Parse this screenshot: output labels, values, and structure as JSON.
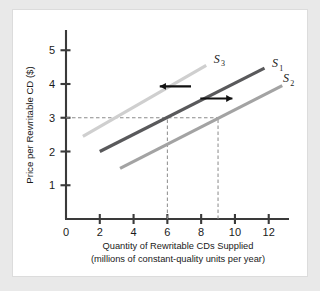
{
  "figure": {
    "background_color": "#e9e9e9",
    "panel_color": "#ffffff"
  },
  "chart_data": {
    "type": "line",
    "title": "",
    "xlabel_line1": "Quantity of Rewritable CDs Supplied",
    "xlabel_line2": "(millions of constant-quality units per year)",
    "ylabel": "Price per Rewritable CD ($)",
    "xlim": [
      0,
      13.2
    ],
    "ylim": [
      0,
      5.6
    ],
    "xticks": [
      0,
      2,
      4,
      6,
      8,
      10,
      12
    ],
    "xtick_labels": [
      "0",
      "2",
      "4",
      "6",
      "8",
      "10",
      "12"
    ],
    "yticks": [
      1,
      2,
      3,
      4,
      5
    ],
    "ytick_labels": [
      "1",
      "2",
      "3",
      "4",
      "5"
    ],
    "grid": false,
    "legend_position": "inline-right",
    "series": [
      {
        "name": "S3",
        "label": "S",
        "subscript": "3",
        "color": "#cfcfcf",
        "x": [
          1.0,
          8.3
        ],
        "y": [
          2.45,
          4.55
        ],
        "label_x": 8.75,
        "label_y": 4.62
      },
      {
        "name": "S1",
        "label": "S",
        "subscript": "1",
        "color": "#59595b",
        "x": [
          2.0,
          11.75
        ],
        "y": [
          2.0,
          4.47
        ],
        "label_x": 12.2,
        "label_y": 4.5
      },
      {
        "name": "S2",
        "label": "S",
        "subscript": "2",
        "color": "#a3a3a3",
        "x": [
          3.2,
          12.8
        ],
        "y": [
          1.5,
          3.95
        ],
        "label_x": 12.85,
        "label_y": 4.05
      }
    ],
    "reference_lines": [
      {
        "name": "price-3-horizontal",
        "orientation": "horizontal",
        "value": 3,
        "from": 0,
        "to": 9.0,
        "style": "dashed",
        "color": "#8a8a8a"
      },
      {
        "name": "quantity-6-vertical",
        "orientation": "vertical",
        "value": 6,
        "from": 0,
        "to": 3,
        "style": "dashed",
        "color": "#8a8a8a"
      },
      {
        "name": "quantity-9-vertical",
        "orientation": "vertical",
        "value": 9,
        "from": 0,
        "to": 3,
        "style": "dashed",
        "color": "#8a8a8a"
      }
    ],
    "annotations": [
      {
        "name": "shift-left-arrow",
        "direction": "left",
        "x_tail": 7.4,
        "x_head": 5.55,
        "y": 3.93,
        "color": "#111111"
      },
      {
        "name": "shift-right-arrow",
        "direction": "right",
        "x_tail": 7.95,
        "x_head": 9.85,
        "y": 3.57,
        "color": "#111111"
      }
    ],
    "equilibrium_points": [
      {
        "name": "s1-at-price-3",
        "quantity": 6,
        "price": 3
      },
      {
        "name": "s2-at-price-3",
        "quantity": 9,
        "price": 3
      }
    ]
  }
}
